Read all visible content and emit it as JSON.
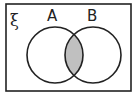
{
  "diagram": {
    "type": "venn",
    "universal_set_symbol": "ξ",
    "sets": [
      {
        "label": "A"
      },
      {
        "label": "B"
      }
    ],
    "shaded_region": "A ∩ B",
    "colors": {
      "stroke": "#222222",
      "shade": "#c0c0c0",
      "background": "#ffffff"
    }
  }
}
